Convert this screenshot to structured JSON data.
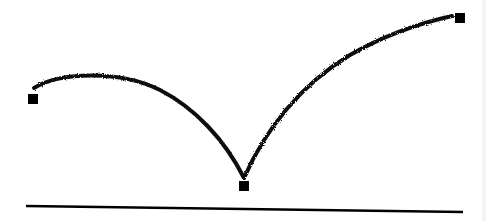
{
  "diagram": {
    "colors": {
      "stroke": "#111111",
      "node": "#000000",
      "background": "#ffffff"
    },
    "nodes": [
      {
        "id": "left-node",
        "x": 33,
        "y": 99,
        "size": 10
      },
      {
        "id": "bottom-node",
        "x": 244,
        "y": 186,
        "size": 10
      },
      {
        "id": "right-node",
        "x": 460,
        "y": 18,
        "size": 10
      }
    ],
    "arcs": [
      {
        "id": "left-arc",
        "path": "M34 88 C 60 72, 120 70, 160 90 C 195 108, 225 140, 244 178"
      },
      {
        "id": "right-arc",
        "path": "M244 178 C 265 130, 300 85, 350 55 C 390 32, 425 22, 452 16"
      }
    ],
    "baseline": {
      "x1": 26,
      "y1": 206,
      "x2": 463,
      "y2": 212
    }
  }
}
